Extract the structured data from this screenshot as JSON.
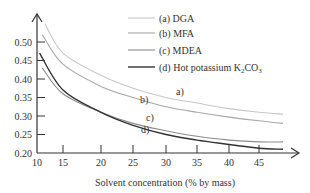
{
  "chart_data": {
    "type": "line",
    "title": "",
    "xlabel": "Solvent concentration (% by mass)",
    "ylabel": "",
    "xlim": [
      10,
      50
    ],
    "ylim": [
      0.2,
      0.55
    ],
    "grid": false,
    "legend_position": "top-right",
    "x_ticks": [
      "10",
      "15",
      "20",
      "25",
      "30",
      "35",
      "40",
      "45"
    ],
    "y_ticks": [
      "0.20",
      "0.25",
      "0.30",
      "0.35",
      "0.40",
      "0.45",
      "0.50"
    ],
    "series": [
      {
        "name": "(a) DGA",
        "label": "a)",
        "color": "#c8c8c8",
        "x": [
          11.5,
          15,
          20,
          25,
          30,
          35,
          40,
          45,
          49
        ],
        "values": [
          0.55,
          0.47,
          0.41,
          0.375,
          0.35,
          0.335,
          0.32,
          0.31,
          0.305
        ]
      },
      {
        "name": "(b) MFA",
        "label": "b)",
        "color": "#a8a8a8",
        "x": [
          11,
          15,
          20,
          25,
          30,
          35,
          40,
          45,
          49
        ],
        "values": [
          0.52,
          0.44,
          0.38,
          0.35,
          0.325,
          0.31,
          0.297,
          0.287,
          0.28
        ]
      },
      {
        "name": "(c) MDEA",
        "label": "c)",
        "color": "#8c8c8c",
        "x": [
          11,
          15,
          20,
          25,
          30,
          35,
          40,
          45,
          49
        ],
        "values": [
          0.43,
          0.36,
          0.31,
          0.28,
          0.26,
          0.245,
          0.235,
          0.23,
          0.23
        ]
      },
      {
        "name": "(d) Hot potassium K2CO3",
        "label": "d)",
        "color": "#333333",
        "x": [
          10.5,
          15,
          20,
          25,
          30,
          35,
          40,
          45,
          49
        ],
        "values": [
          0.47,
          0.37,
          0.31,
          0.275,
          0.25,
          0.235,
          0.223,
          0.213,
          0.21
        ]
      }
    ]
  },
  "legend": {
    "items": [
      {
        "prefix": "(a) DGA",
        "sub": "",
        "suffix": ""
      },
      {
        "prefix": "(b) MFA",
        "sub": "",
        "suffix": ""
      },
      {
        "prefix": "(c) MDEA",
        "sub": "",
        "suffix": ""
      },
      {
        "prefix": "(d) Hot potassium K",
        "sub": "2",
        "suffix": "CO",
        "sub2": "3"
      }
    ]
  }
}
